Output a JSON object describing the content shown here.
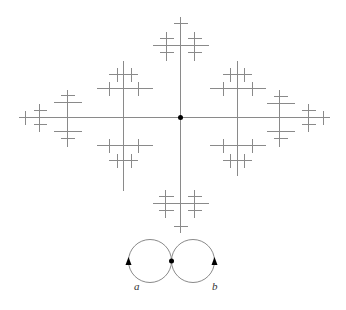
{
  "figure": {
    "tree": {
      "center": [
        180,
        117
      ],
      "center_dot_radius": 2.5,
      "line_color": "#8a8a8a",
      "segments": [
        [
          18,
          117,
          329,
          117
        ],
        [
          180,
          16,
          180,
          232
        ],
        [
          39,
          103,
          39,
          131
        ],
        [
          25,
          110,
          25,
          124
        ],
        [
          33,
          110,
          46,
          110
        ],
        [
          33,
          124,
          46,
          124
        ],
        [
          67,
          89,
          67,
          146
        ],
        [
          53,
          102,
          81,
          102
        ],
        [
          53,
          131,
          81,
          131
        ],
        [
          60,
          95,
          74,
          95
        ],
        [
          60,
          138,
          74,
          138
        ],
        [
          123,
          60,
          123,
          190
        ],
        [
          96,
          88,
          152,
          88
        ],
        [
          96,
          145,
          152,
          145
        ],
        [
          109,
          81,
          109,
          95
        ],
        [
          138,
          81,
          138,
          95
        ],
        [
          109,
          138,
          109,
          152
        ],
        [
          138,
          138,
          138,
          152
        ],
        [
          108,
          74,
          137,
          74
        ],
        [
          117,
          67,
          117,
          81
        ],
        [
          131,
          67,
          131,
          81
        ],
        [
          108,
          160,
          137,
          160
        ],
        [
          117,
          153,
          117,
          167
        ],
        [
          131,
          153,
          131,
          167
        ],
        [
          237,
          60,
          237,
          175
        ],
        [
          209,
          88,
          265,
          88
        ],
        [
          209,
          145,
          265,
          145
        ],
        [
          223,
          81,
          223,
          95
        ],
        [
          252,
          81,
          252,
          95
        ],
        [
          223,
          138,
          223,
          152
        ],
        [
          252,
          138,
          252,
          152
        ],
        [
          222,
          74,
          251,
          74
        ],
        [
          230,
          67,
          230,
          81
        ],
        [
          244,
          67,
          244,
          81
        ],
        [
          222,
          160,
          251,
          160
        ],
        [
          230,
          153,
          230,
          167
        ],
        [
          244,
          153,
          244,
          167
        ],
        [
          279,
          89,
          279,
          146
        ],
        [
          266,
          103,
          294,
          103
        ],
        [
          266,
          131,
          294,
          131
        ],
        [
          273,
          96,
          287,
          96
        ],
        [
          273,
          138,
          287,
          138
        ],
        [
          308,
          103,
          308,
          131
        ],
        [
          301,
          110,
          315,
          110
        ],
        [
          301,
          124,
          315,
          124
        ],
        [
          323,
          110,
          323,
          124
        ],
        [
          152,
          45,
          208,
          45
        ],
        [
          173,
          23,
          187,
          23
        ],
        [
          166,
          31,
          166,
          60
        ],
        [
          194,
          31,
          194,
          60
        ],
        [
          159,
          38,
          173,
          38
        ],
        [
          159,
          52,
          173,
          52
        ],
        [
          187,
          38,
          201,
          38
        ],
        [
          187,
          52,
          201,
          52
        ],
        [
          152,
          203,
          208,
          203
        ],
        [
          173,
          226,
          187,
          226
        ],
        [
          165,
          189,
          165,
          217
        ],
        [
          194,
          189,
          194,
          217
        ],
        [
          158,
          196,
          173,
          196
        ],
        [
          158,
          210,
          173,
          210
        ],
        [
          187,
          196,
          201,
          196
        ],
        [
          187,
          210,
          201,
          210
        ]
      ]
    },
    "rose": {
      "left_loop": {
        "cx": 150,
        "cy": 261,
        "r": 21.5
      },
      "right_loop": {
        "cx": 193,
        "cy": 261,
        "r": 21.5
      },
      "vertex": [
        171.5,
        261
      ],
      "arrows": [
        {
          "x": 128.5,
          "y": 262,
          "direction": "up"
        },
        {
          "x": 214.5,
          "y": 262,
          "direction": "up"
        }
      ],
      "labels": [
        {
          "text": "a",
          "x": 134,
          "y": 290
        },
        {
          "text": "b",
          "x": 212,
          "y": 290
        }
      ]
    }
  }
}
